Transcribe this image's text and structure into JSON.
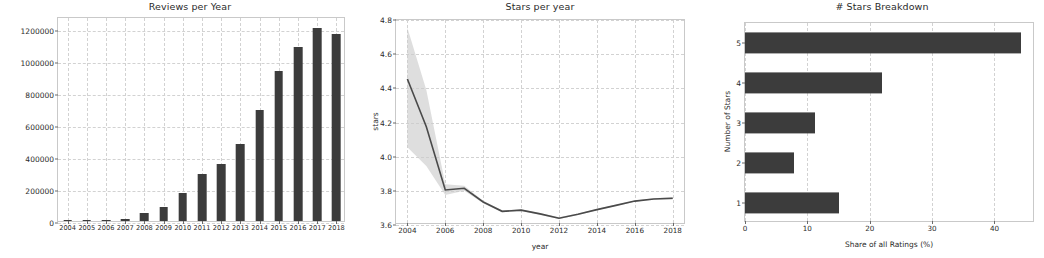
{
  "figure": {
    "width": 1044,
    "height": 258,
    "background": "#ffffff",
    "bar_color": "#3c3c3c",
    "line_color": "#4a4a4a",
    "band_color": "#cccccc",
    "grid_color": "#d2d2d2",
    "axis_color": "#c9c9c9"
  },
  "panels": {
    "reviews": {
      "title": "Reviews per Year",
      "xlabel": "",
      "ylabel": "",
      "ytick_labels": [
        "0",
        "200000",
        "400000",
        "600000",
        "800000",
        "1000000",
        "1200000"
      ]
    },
    "stars_per_year": {
      "title": "Stars per year",
      "xlabel": "year",
      "ylabel": "stars",
      "ytick_labels": [
        "3.6",
        "3.8",
        "4.0",
        "4.2",
        "4.4",
        "4.6",
        "4.8"
      ],
      "xtick_labels": [
        "2004",
        "2006",
        "2008",
        "2010",
        "2012",
        "2014",
        "2016",
        "2018"
      ]
    },
    "stars_breakdown": {
      "title": "# Stars Breakdown",
      "xlabel": "Share of all Ratings (%)",
      "ylabel": "Number of Stars",
      "xtick_labels": [
        "0",
        "10",
        "20",
        "30",
        "40"
      ],
      "ytick_labels": [
        "1",
        "2",
        "3",
        "4",
        "5"
      ]
    }
  },
  "chart_data": [
    {
      "type": "bar",
      "id": "reviews-per-year",
      "title": "Reviews per Year",
      "xlabel": "",
      "ylabel": "",
      "orientation": "vertical",
      "grid": true,
      "categories": [
        "2004",
        "2005",
        "2006",
        "2007",
        "2008",
        "2009",
        "2010",
        "2011",
        "2012",
        "2013",
        "2014",
        "2015",
        "2016",
        "2017",
        "2018"
      ],
      "values": [
        800,
        2000,
        4000,
        14000,
        48000,
        88000,
        175000,
        292000,
        355000,
        480000,
        692000,
        935000,
        1088000,
        1208000,
        1168000
      ],
      "ylim": [
        0,
        1280000
      ],
      "yticks": [
        0,
        200000,
        400000,
        600000,
        800000,
        1000000,
        1200000
      ],
      "ytick_labels": [
        "0",
        "200000",
        "400000",
        "600000",
        "800000",
        "1000000",
        "1200000"
      ]
    },
    {
      "type": "line",
      "id": "stars-per-year",
      "title": "Stars per year",
      "xlabel": "year",
      "ylabel": "stars",
      "grid": true,
      "x": [
        2004,
        2005,
        2006,
        2007,
        2008,
        2009,
        2010,
        2011,
        2012,
        2013,
        2014,
        2015,
        2016,
        2017,
        2018
      ],
      "series": [
        {
          "name": "mean stars",
          "values": [
            4.455,
            4.175,
            3.805,
            3.815,
            3.735,
            3.68,
            3.687,
            3.665,
            3.64,
            3.663,
            3.69,
            3.715,
            3.74,
            3.752,
            3.757
          ]
        }
      ],
      "band": {
        "name": "95% confidence interval",
        "lower": [
          4.055,
          3.945,
          3.775,
          3.8,
          3.728,
          3.674,
          3.682,
          3.66,
          3.635,
          3.658,
          3.686,
          3.711,
          3.736,
          3.748,
          3.75
        ],
        "upper": [
          4.755,
          4.39,
          3.838,
          3.83,
          3.742,
          3.686,
          3.692,
          3.67,
          3.645,
          3.668,
          3.694,
          3.719,
          3.744,
          3.756,
          3.764
        ]
      },
      "xlim": [
        2003.4,
        2018.7
      ],
      "ylim": [
        3.6,
        4.8
      ],
      "yticks": [
        3.6,
        3.8,
        4.0,
        4.2,
        4.4,
        4.6,
        4.8
      ],
      "xticks": [
        2004,
        2006,
        2008,
        2010,
        2012,
        2014,
        2016,
        2018
      ]
    },
    {
      "type": "bar",
      "id": "stars-breakdown",
      "title": "# Stars Breakdown",
      "xlabel": "Share of all Ratings (%)",
      "ylabel": "Number of Stars",
      "orientation": "horizontal",
      "grid": true,
      "categories": [
        "1",
        "2",
        "3",
        "4",
        "5"
      ],
      "values": [
        15.1,
        7.8,
        11.3,
        21.9,
        44.2
      ],
      "xlim": [
        0,
        46.5
      ],
      "xticks": [
        0,
        10,
        20,
        30,
        40
      ]
    }
  ]
}
